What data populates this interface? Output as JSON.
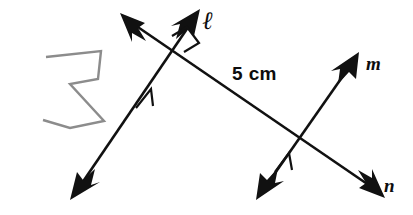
{
  "diagram": {
    "background_color": "#ffffff",
    "stroke_color": "#111111",
    "polygon_color": "#8c8c8c",
    "labels": {
      "line_ell": "ℓ",
      "line_m": "m",
      "line_n": "n",
      "measurement": "5 cm"
    },
    "lines": [
      {
        "name": "ell",
        "label": "ℓ",
        "arrowheads": "double",
        "from": [
          72,
          198
        ],
        "to": [
          199,
          11
        ],
        "tick_marks": 1
      },
      {
        "name": "n",
        "label": "n",
        "arrowheads": "double",
        "from": [
          122,
          15
        ],
        "to": [
          383,
          196
        ],
        "tick_marks": 0
      },
      {
        "name": "m",
        "label": "m",
        "arrowheads": "double",
        "from": [
          258,
          198
        ],
        "to": [
          358,
          54
        ],
        "tick_marks": 1
      }
    ],
    "intersections": [
      {
        "name": "ell-n",
        "point": [
          177,
          47
        ],
        "right_angle": true
      },
      {
        "name": "m-n",
        "point": [
          308,
          144
        ],
        "right_angle": false
      }
    ],
    "segment_measure": {
      "text": "5 cm",
      "value": 5,
      "unit": "cm",
      "between": [
        "ell-n",
        "m-n"
      ]
    },
    "polygon": {
      "name": "gray-polygon",
      "stroke": "#8c8c8c",
      "fill": "none",
      "points": "46,57 101,51 98,79 70,84 104,121 70,128 43,120"
    }
  }
}
